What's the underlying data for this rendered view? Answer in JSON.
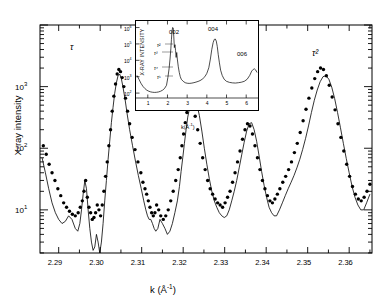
{
  "figure": {
    "title": "",
    "axes": {
      "x": {
        "label": "k (Å⁻¹)",
        "ticks": [
          "2.29",
          "2.30",
          "2.31",
          "2.32",
          "2.33",
          "2.34",
          "2.35",
          "2.36"
        ],
        "range": [
          2.2855,
          2.3655
        ]
      },
      "y": {
        "label": "X-ray intensity",
        "ticks": [
          "10³",
          "10²",
          "10¹"
        ],
        "range_log": [
          0.3,
          4.0
        ]
      }
    },
    "annotations": [
      {
        "name": "tau-label",
        "text": "τ",
        "x": 70,
        "y": 42
      },
      {
        "name": "tau-squared-label",
        "text": "τ²",
        "x": 312,
        "y": 48
      }
    ]
  },
  "inset": {
    "axes": {
      "x": {
        "label": "k(Å⁻¹)",
        "ticks": [
          "1",
          "2",
          "3",
          "4",
          "5",
          "6"
        ],
        "range": [
          0.4,
          6.6
        ]
      },
      "y": {
        "label": "X-RAY INTENSITY",
        "ticks": [
          "10⁶",
          "10⁵",
          "10⁴",
          "10³",
          "10²"
        ],
        "range_log": [
          1.7,
          6.4
        ]
      }
    },
    "peak_labels": [
      {
        "name": "peak-002",
        "text": "002",
        "x": 33,
        "y": 8
      },
      {
        "name": "peak-004",
        "text": "004",
        "x": 72,
        "y": 5
      },
      {
        "name": "peak-006",
        "text": "006",
        "x": 101,
        "y": 30
      }
    ],
    "tau_labels": [
      {
        "name": "inset-tau-2",
        "text": "τ²",
        "x": 21,
        "y": 21
      },
      {
        "name": "inset-tau-3",
        "text": "τ³",
        "x": 18,
        "y": 29
      },
      {
        "name": "inset-tau-4",
        "text": "τ⁴",
        "x": 18,
        "y": 44
      },
      {
        "name": "inset-tau-5",
        "text": "τ⁵",
        "x": 21,
        "y": 53
      }
    ]
  },
  "chart_data": {
    "type": "line",
    "title": "",
    "xlabel": "k (Å⁻¹)",
    "ylabel": "X-ray intensity",
    "xlim": [
      2.2855,
      2.3655
    ],
    "ylim_log": [
      0.3,
      4.0
    ],
    "yscale": "log",
    "grid": false,
    "legend": null,
    "series": [
      {
        "name": "measured",
        "marker": "filled-circle",
        "style": "points",
        "x": [
          2.2863,
          2.287,
          2.2877,
          2.2884,
          2.2891,
          2.2898,
          2.2905,
          2.2912,
          2.2919,
          2.2926,
          2.2933,
          2.294,
          2.2947,
          2.2952,
          2.2957,
          2.2961,
          2.2965,
          2.2969,
          2.2973,
          2.2977,
          2.2981,
          2.2985,
          2.2989,
          2.2993,
          2.2997,
          2.3001,
          2.3005,
          2.3009,
          2.3013,
          2.3017,
          2.3021,
          2.3025,
          2.3029,
          2.3033,
          2.3037,
          2.3041,
          2.3045,
          2.3049,
          2.3053,
          2.3057,
          2.3061,
          2.3066,
          2.3071,
          2.3077,
          2.3084,
          2.3091,
          2.3098,
          2.3103,
          2.3108,
          2.3112,
          2.3116,
          2.312,
          2.3124,
          2.3128,
          2.3132,
          2.3136,
          2.3141,
          2.3146,
          2.3152,
          2.3158,
          2.3164,
          2.317,
          2.3176,
          2.3182,
          2.3188,
          2.3193,
          2.3197,
          2.3201,
          2.3205,
          2.3209,
          2.3213,
          2.3218,
          2.3223,
          2.3229,
          2.3235,
          2.3241,
          2.3247,
          2.3253,
          2.3259,
          2.3265,
          2.3271,
          2.3277,
          2.3283,
          2.3289,
          2.3295,
          2.3301,
          2.3307,
          2.3313,
          2.3319,
          2.3325,
          2.3331,
          2.3337,
          2.3343,
          2.3349,
          2.3355,
          2.3361,
          2.3367,
          2.3373,
          2.3379,
          2.3385,
          2.3391,
          2.3397,
          2.3403,
          2.3409,
          2.3415,
          2.3421,
          2.3427,
          2.3433,
          2.344,
          2.3447,
          2.3454,
          2.3461,
          2.3468,
          2.3475,
          2.3482,
          2.3489,
          2.3496,
          2.3503,
          2.351,
          2.3517,
          2.3524,
          2.3531,
          2.3538,
          2.3545,
          2.3552,
          2.3559,
          2.3566,
          2.3573,
          2.358,
          2.3587,
          2.3594,
          2.3601,
          2.3608,
          2.3615,
          2.3622,
          2.3629,
          2.3636,
          2.3643,
          2.365
        ],
        "y": [
          110,
          80,
          55,
          40,
          30,
          22,
          17,
          13,
          11,
          9.5,
          8.5,
          8,
          9,
          11,
          14,
          20,
          30,
          16,
          11,
          9,
          7,
          7.5,
          9,
          12,
          10,
          8,
          12,
          20,
          35,
          60,
          110,
          200,
          400,
          700,
          1100,
          1600,
          1900,
          1750,
          1400,
          1000,
          650,
          400,
          250,
          150,
          95,
          60,
          40,
          28,
          22,
          18,
          14,
          11,
          9,
          8,
          9,
          12,
          10,
          8,
          7,
          8,
          10,
          14,
          20,
          30,
          45,
          70,
          110,
          170,
          260,
          380,
          520,
          620,
          500,
          330,
          200,
          120,
          70,
          45,
          30,
          22,
          18,
          15,
          13,
          12,
          11,
          13,
          16,
          20,
          28,
          40,
          60,
          90,
          140,
          200,
          250,
          230,
          170,
          110,
          70,
          45,
          30,
          22,
          17,
          14,
          13,
          15,
          18,
          22,
          28,
          35,
          45,
          60,
          85,
          120,
          180,
          280,
          430,
          650,
          950,
          1350,
          1750,
          2000,
          1900,
          1500,
          1050,
          680,
          420,
          250,
          150,
          90,
          55,
          35,
          24,
          18,
          15,
          14,
          16,
          20,
          26
        ]
      },
      {
        "name": "calculated",
        "style": "line",
        "x": [
          2.286,
          2.2868,
          2.2876,
          2.2884,
          2.2892,
          2.29,
          2.2908,
          2.2916,
          2.2924,
          2.2932,
          2.294,
          2.2946,
          2.2951,
          2.2955,
          2.2959,
          2.2963,
          2.2967,
          2.2971,
          2.2975,
          2.2979,
          2.2983,
          2.2987,
          2.2991,
          2.2995,
          2.2999,
          2.3003,
          2.3007,
          2.3011,
          2.3015,
          2.3019,
          2.3023,
          2.3027,
          2.3031,
          2.3035,
          2.3039,
          2.3043,
          2.3047,
          2.3051,
          2.3055,
          2.306,
          2.3065,
          2.3071,
          2.3078,
          2.3085,
          2.3092,
          2.3099,
          2.3105,
          2.311,
          2.3114,
          2.3118,
          2.3122,
          2.3126,
          2.313,
          2.3134,
          2.3139,
          2.3144,
          2.315,
          2.3156,
          2.3162,
          2.3168,
          2.3174,
          2.318,
          2.3186,
          2.3191,
          2.3195,
          2.3199,
          2.3203,
          2.3207,
          2.3211,
          2.3216,
          2.3221,
          2.3227,
          2.3233,
          2.3239,
          2.3245,
          2.3251,
          2.3257,
          2.3263,
          2.3269,
          2.3275,
          2.3281,
          2.3287,
          2.3293,
          2.3299,
          2.3305,
          2.3311,
          2.3317,
          2.3323,
          2.3329,
          2.3335,
          2.3341,
          2.3347,
          2.3353,
          2.3359,
          2.3365,
          2.3371,
          2.3377,
          2.3383,
          2.3389,
          2.3395,
          2.3401,
          2.3407,
          2.3413,
          2.3419,
          2.3425,
          2.3432,
          2.3439,
          2.3446,
          2.3453,
          2.346,
          2.3467,
          2.3474,
          2.3481,
          2.3488,
          2.3495,
          2.3502,
          2.3509,
          2.3516,
          2.3523,
          2.353,
          2.3537,
          2.3544,
          2.3551,
          2.3558,
          2.3565,
          2.3572,
          2.3579,
          2.3586,
          2.3593,
          2.36,
          2.3607,
          2.3614,
          2.3621,
          2.3628,
          2.3635,
          2.3642,
          2.365
        ],
        "y": [
          70,
          40,
          22,
          13,
          9,
          7,
          6,
          6.5,
          8,
          7,
          5,
          4.5,
          6,
          10,
          18,
          30,
          22,
          10,
          5,
          3,
          2.2,
          2.5,
          4,
          3,
          2,
          3,
          6,
          14,
          30,
          65,
          130,
          260,
          460,
          780,
          1150,
          1500,
          1600,
          1350,
          980,
          620,
          360,
          200,
          110,
          62,
          36,
          22,
          14,
          10,
          8,
          7,
          7,
          6,
          5,
          4.5,
          5,
          7,
          6,
          5,
          4,
          4.5,
          6,
          9,
          14,
          24,
          42,
          70,
          120,
          200,
          320,
          470,
          600,
          640,
          520,
          340,
          190,
          100,
          55,
          32,
          20,
          14,
          11,
          9,
          8,
          7.5,
          8,
          10,
          14,
          20,
          30,
          48,
          78,
          125,
          190,
          250,
          260,
          200,
          130,
          75,
          42,
          25,
          16,
          11,
          9,
          8,
          8,
          10,
          13,
          17,
          22,
          28,
          36,
          48,
          66,
          96,
          145,
          230,
          380,
          600,
          880,
          1200,
          1450,
          1500,
          1320,
          980,
          640,
          380,
          215,
          120,
          68,
          40,
          24,
          16,
          12,
          10,
          10,
          13,
          18
        ]
      }
    ]
  },
  "inset_chart_data": {
    "type": "line",
    "xlabel": "k(Å⁻¹)",
    "ylabel": "X-RAY INTENSITY",
    "xlim": [
      0.4,
      6.6
    ],
    "ylim_log": [
      1.7,
      6.4
    ],
    "yscale": "log",
    "peaks": [
      {
        "label": "002",
        "k": 2.29,
        "intensity": 1000000
      },
      {
        "label": "004",
        "k": 4.45,
        "intensity": 200000
      },
      {
        "label": "006",
        "k": 6.45,
        "intensity": 3000
      }
    ],
    "series": [
      {
        "name": "powder-pattern",
        "style": "line",
        "x": [
          0.45,
          0.55,
          0.65,
          0.75,
          0.85,
          0.95,
          1.05,
          1.15,
          1.25,
          1.35,
          1.45,
          1.55,
          1.65,
          1.75,
          1.85,
          1.95,
          2.02,
          2.08,
          2.13,
          2.17,
          2.2,
          2.23,
          2.26,
          2.29,
          2.32,
          2.35,
          2.38,
          2.41,
          2.44,
          2.47,
          2.5,
          2.55,
          2.6,
          2.65,
          2.7,
          2.8,
          2.9,
          3.0,
          3.1,
          3.2,
          3.3,
          3.4,
          3.5,
          3.6,
          3.7,
          3.8,
          3.9,
          4.0,
          4.1,
          4.18,
          4.25,
          4.32,
          4.38,
          4.43,
          4.48,
          4.53,
          4.58,
          4.64,
          4.7,
          4.78,
          4.88,
          5.0,
          5.15,
          5.3,
          5.45,
          5.6,
          5.75,
          5.9,
          6.05,
          6.18,
          6.28,
          6.36,
          6.42,
          6.48,
          6.55
        ],
        "y": [
          1200,
          700,
          400,
          260,
          190,
          150,
          130,
          118,
          112,
          110,
          112,
          118,
          130,
          150,
          190,
          300,
          900,
          3000,
          12000,
          50000,
          180000,
          600000,
          1000000,
          950000,
          300000,
          60000,
          90000,
          40000,
          15000,
          30000,
          12000,
          4000,
          1800,
          1000,
          700,
          520,
          430,
          400,
          390,
          400,
          420,
          450,
          490,
          540,
          620,
          760,
          1000,
          1600,
          3500,
          12000,
          45000,
          120000,
          190000,
          200000,
          150000,
          70000,
          22000,
          7000,
          2500,
          1200,
          700,
          520,
          450,
          420,
          410,
          430,
          460,
          520,
          700,
          1200,
          2200,
          2800,
          3000,
          2600,
          1800
        ]
      }
    ]
  }
}
